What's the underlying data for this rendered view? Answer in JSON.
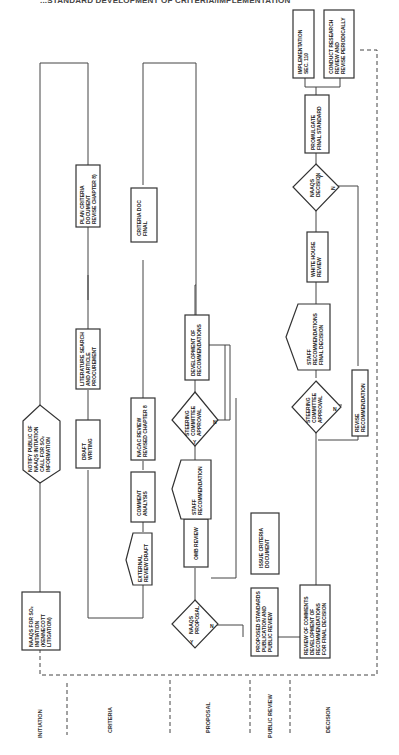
{
  "header": {
    "title": "...STANDARD DEVELOPMENT OF CRITERIA/IMPLEMENTATION"
  },
  "phases": [
    {
      "id": "initiation",
      "label": "INITIATION"
    },
    {
      "id": "criteria",
      "label": "CRITERIA"
    },
    {
      "id": "proposal",
      "label": "PROPOSAL"
    },
    {
      "id": "public_review",
      "label": "PUBLIC REVIEW"
    },
    {
      "id": "decision",
      "label": "DECISION"
    }
  ],
  "nodes": {
    "naaqs_init": [
      "NAAQS FOR SO₂",
      "INITIATION",
      "(KENNECOTT",
      "LITIGATION)"
    ],
    "notify_public": [
      "NOTIFY PUBLIC OF",
      "NAAQS INITIATION",
      "CALL FOR SO₂",
      "INFORMATION"
    ],
    "draft_writing": [
      "DRAFT",
      "WRITING"
    ],
    "lit_search": [
      "LITERATURE SEARCH",
      "AND ARTICLE",
      "PROCUREMENT"
    ],
    "plan_criteria": [
      "PLAN CRITERIA",
      "DOCUMENT",
      "REVISE CHAPTER 8)"
    ],
    "external_review": [
      "EXTERNAL",
      "REVIEW DRAFT"
    ],
    "comment_analysis": [
      "COMMENT",
      "ANALYSIS"
    ],
    "nacac_review": [
      "NACAC REVIEW",
      "REVISED CHAPTER 8"
    ],
    "criteria_doc_final": [
      "CRITERIA DOC",
      "FINAL"
    ],
    "naaqs_proposal": [
      "NAAQS",
      "PROPOSAL"
    ],
    "omb_review": [
      "OMB REVIEW"
    ],
    "staff_recommendation": [
      "STAFF",
      "RECOMMENDATION"
    ],
    "steering_approval_1": [
      "STEERING",
      "COMMITTEE",
      "APPROVAL"
    ],
    "dev_recommendations": [
      "DEVELOPMENT OF",
      "RECOMMENDATIONS"
    ],
    "proposed_standards": [
      "PROPOSED STANDARDS",
      "PUBLICATION AND",
      "PUBLIC REVIEW"
    ],
    "issue_criteria": [
      "ISSUE CRITERIA",
      "DOCUMENT"
    ],
    "review_comments": [
      "REVIEW OF COMMENTS",
      "DEVELOPMENT OF",
      "RECOMMENDATIONS",
      "FOR FINAL DECISION"
    ],
    "steering_approval_2": [
      "STEERING",
      "COMMITTEE",
      "APPROVAL"
    ],
    "revise_recommendation": [
      "REVISE",
      "RECOMMENDATION"
    ],
    "staff_rec_final": [
      "STAFF",
      "RECOMMENDATIONS",
      "FINAL DECISION"
    ],
    "white_house_review": [
      "WHITE HOUSE",
      "REVIEW"
    ],
    "naaqs_decision": [
      "NAAQS",
      "DECISION"
    ],
    "promulgate": [
      "PROMULGATE",
      "FINAL STANDARD"
    ],
    "implementation": [
      "IMPLEMENTATION",
      "SEC. 110"
    ],
    "conduct_research": [
      "CONDUCT RESEARCH",
      "REVIEW AND",
      "REVISE PERIODICALLY"
    ]
  },
  "decision_labels": {
    "yes": "Y",
    "no": "N"
  }
}
